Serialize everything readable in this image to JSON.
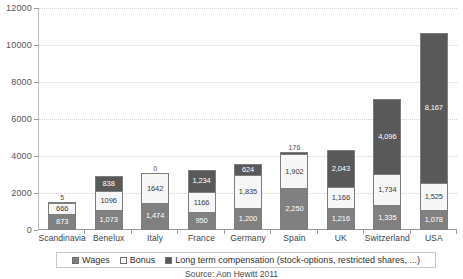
{
  "chart_data": {
    "type": "bar",
    "subtype": "stacked-vertical",
    "title": "",
    "xlabel": "",
    "ylabel": "",
    "ylim": [
      0,
      12000
    ],
    "ytick_step": 2000,
    "yticks": [
      0,
      2000,
      4000,
      6000,
      8000,
      10000,
      12000
    ],
    "ytick_labels": [
      "0",
      "2000",
      "4000",
      "6000",
      "8000",
      "10000",
      "12000"
    ],
    "grid": true,
    "legend_position": "bottom",
    "categories": [
      "Scandinavia",
      "Benelux",
      "Italy",
      "France",
      "Germany",
      "Spain",
      "UK",
      "Switzerland",
      "USA"
    ],
    "series": [
      {
        "name": "Wages",
        "color": "#808080",
        "values": [
          873,
          1073,
          1474,
          950,
          1200,
          2250,
          1216,
          1335,
          1078
        ],
        "labels": [
          "873",
          "1,073",
          "1,474",
          "950",
          "1,200",
          "2,250",
          "1,216",
          "1,335",
          "1,078"
        ]
      },
      {
        "name": "Bonus",
        "color": "#f7f7f7",
        "values": [
          666,
          1096,
          1642,
          1166,
          1835,
          1902,
          1166,
          1734,
          1525
        ],
        "labels": [
          "666",
          "1096",
          "1642",
          "1166",
          "1,835",
          "1,902",
          "1,166",
          "1,734",
          "1,525"
        ]
      },
      {
        "name": "Long term compensation (stock-options, restricted shares, ...)",
        "color": "#595959",
        "values": [
          5,
          838,
          0,
          1234,
          624,
          176,
          2043,
          4096,
          8167
        ],
        "labels": [
          "5",
          "838",
          "0",
          "1,234",
          "624",
          "176",
          "2,043",
          "4,096",
          "8,167"
        ]
      }
    ],
    "totals": [
      1544,
      3007,
      3116,
      3350,
      3659,
      4328,
      4425,
      7165,
      10770
    ],
    "annotations": {
      "source": "Source: Aon Hewitt 2011"
    }
  },
  "legend": {
    "items": [
      {
        "label": "Wages",
        "swatch": "wages-swatch"
      },
      {
        "label": "Bonus",
        "swatch": "bonus-swatch"
      },
      {
        "label": "Long term compensation (stock-options, restricted shares, ...)",
        "swatch": "ltc-swatch"
      }
    ]
  },
  "source_note": "Source: Aon Hewitt 2011"
}
